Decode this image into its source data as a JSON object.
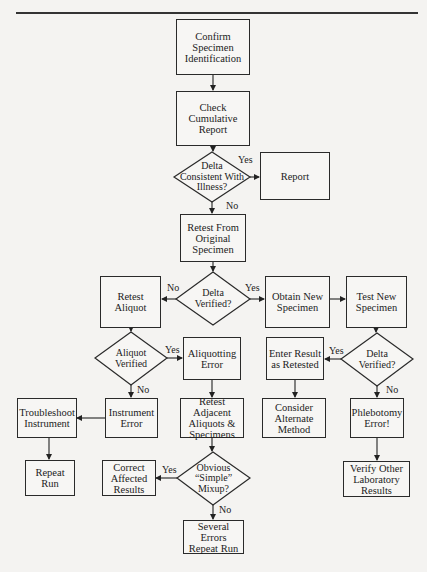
{
  "flowchart": {
    "nodes": {
      "confirm": "Confirm\nSpecimen\nIdentification",
      "check": "Check\nCumulative\nReport",
      "delta_consistent": "Delta\nConsistent With\nIllness?",
      "report": "Report",
      "retest_original": "Retest From\nOriginal\nSpecimen",
      "delta_verified_1": "Delta\nVerified?",
      "retest_aliquot": "Retest\nAliquot",
      "obtain_new": "Obtain New\nSpecimen",
      "test_new": "Test New\nSpecimen",
      "aliquot_verified": "Aliquot\nVerified",
      "aliquotting_error": "Aliquotting\nError",
      "enter_result": "Enter Result\nas Retested",
      "delta_verified_2": "Delta\nVerified?",
      "instrument_error": "Instrument\nError",
      "troubleshoot": "Troubleshoot\nInstrument",
      "retest_adjacent": "Retest Adjacent\nAliquots &\nSpecimens",
      "consider_alternate": "Consider\nAlternate\nMethod",
      "phlebotomy_error": "Phlebotomy\nError!",
      "repeat_run": "Repeat\nRun",
      "correct_affected": "Correct\nAffected\nResults",
      "obvious_mixup": "Obvious\n“Simple”\nMixup?",
      "verify_other": "Verify Other\nLaboratory\nResults",
      "several_errors": "Several Errors\nRepeat Run"
    },
    "labels": {
      "yes": "Yes",
      "no": "No"
    },
    "edges": [
      {
        "from": "confirm",
        "to": "check"
      },
      {
        "from": "check",
        "to": "delta_consistent"
      },
      {
        "from": "delta_consistent",
        "to": "report",
        "label": "Yes"
      },
      {
        "from": "delta_consistent",
        "to": "retest_original",
        "label": "No"
      },
      {
        "from": "retest_original",
        "to": "delta_verified_1"
      },
      {
        "from": "delta_verified_1",
        "to": "retest_aliquot",
        "label": "No"
      },
      {
        "from": "delta_verified_1",
        "to": "obtain_new",
        "label": "Yes"
      },
      {
        "from": "obtain_new",
        "to": "test_new"
      },
      {
        "from": "retest_aliquot",
        "to": "aliquot_verified"
      },
      {
        "from": "aliquot_verified",
        "to": "aliquotting_error",
        "label": "Yes"
      },
      {
        "from": "aliquot_verified",
        "to": "instrument_error",
        "label": "No"
      },
      {
        "from": "instrument_error",
        "to": "troubleshoot"
      },
      {
        "from": "troubleshoot",
        "to": "repeat_run"
      },
      {
        "from": "aliquotting_error",
        "to": "retest_adjacent"
      },
      {
        "from": "retest_adjacent",
        "to": "obvious_mixup"
      },
      {
        "from": "obvious_mixup",
        "to": "correct_affected",
        "label": "Yes"
      },
      {
        "from": "obvious_mixup",
        "to": "several_errors",
        "label": "No"
      },
      {
        "from": "test_new",
        "to": "delta_verified_2"
      },
      {
        "from": "delta_verified_2",
        "to": "enter_result",
        "label": "Yes"
      },
      {
        "from": "delta_verified_2",
        "to": "phlebotomy_error",
        "label": "No"
      },
      {
        "from": "enter_result",
        "to": "consider_alternate"
      },
      {
        "from": "phlebotomy_error",
        "to": "verify_other"
      }
    ]
  }
}
